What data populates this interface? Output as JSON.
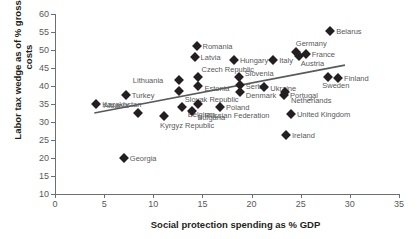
{
  "chart_data": {
    "type": "scatter",
    "title": "",
    "xlabel": "Social protection spending as % GDP",
    "ylabel": "Labor tax wedge as of % gross labor costs",
    "xlim": [
      0,
      35
    ],
    "ylim": [
      10,
      60
    ],
    "xticks": [
      0,
      5,
      10,
      15,
      20,
      25,
      30,
      35
    ],
    "yticks": [
      10,
      15,
      20,
      25,
      30,
      35,
      40,
      45,
      50,
      55,
      60
    ],
    "grid": false,
    "legend": "none",
    "marker_color": "#231f20",
    "trendline_color": "#58595b",
    "trendline": {
      "x0": 4.0,
      "y0": 32.5,
      "x1": 29.5,
      "y1": 45.8
    },
    "points": [
      {
        "label": "Kazakhstan",
        "x": 4.2,
        "y": 34.9,
        "label_dx": 6,
        "label_dy": 1
      },
      {
        "label": "Georgia",
        "x": 7.0,
        "y": 19.9,
        "label_dx": 6,
        "label_dy": 1
      },
      {
        "label": "Turkey",
        "x": 7.2,
        "y": 37.5,
        "label_dx": 6,
        "label_dy": 1
      },
      {
        "label": "Albania",
        "x": 8.4,
        "y": 32.4,
        "label_dx": -34,
        "label_dy": -7
      },
      {
        "label": "Kyrgyz Republic",
        "x": 11.1,
        "y": 31.6,
        "label_dx": -4,
        "label_dy": 10
      },
      {
        "label": "Lithuania",
        "x": 12.6,
        "y": 41.8,
        "label_dx": -46,
        "label_dy": 1
      },
      {
        "label": "Slovak Republic",
        "x": 12.6,
        "y": 38.7,
        "label_dx": 6,
        "label_dy": 9
      },
      {
        "label": "Belgium",
        "x": 12.9,
        "y": 34.3,
        "label_dx": 6,
        "label_dy": 8
      },
      {
        "label": "Bulgaria",
        "x": 13.9,
        "y": 33.0,
        "label_dx": 6,
        "label_dy": 7
      },
      {
        "label": "Latvia",
        "x": 14.2,
        "y": 48.1,
        "label_dx": 6,
        "label_dy": 1
      },
      {
        "label": "Romania",
        "x": 14.4,
        "y": 51.2,
        "label_dx": 6,
        "label_dy": 1
      },
      {
        "label": "Czech Republic",
        "x": 14.5,
        "y": 42.4,
        "label_dx": 4,
        "label_dy": -7
      },
      {
        "label": "Estonia",
        "x": 14.6,
        "y": 39.9,
        "label_dx": 6,
        "label_dy": 3
      },
      {
        "label": "Russian Federation",
        "x": 14.6,
        "y": 35.0,
        "label_dx": 6,
        "label_dy": 12
      },
      {
        "label": "Poland",
        "x": 16.8,
        "y": 34.1,
        "label_dx": 6,
        "label_dy": 1
      },
      {
        "label": "Hungary",
        "x": 18.2,
        "y": 47.3,
        "label_dx": 6,
        "label_dy": 1
      },
      {
        "label": "Slovenia",
        "x": 18.7,
        "y": 42.4,
        "label_dx": 6,
        "label_dy": -3
      },
      {
        "label": "Serbia",
        "x": 18.8,
        "y": 40.3,
        "label_dx": 6,
        "label_dy": 2
      },
      {
        "label": "Denmark",
        "x": 18.8,
        "y": 38.3,
        "label_dx": 6,
        "label_dy": 4
      },
      {
        "label": "Ukraine",
        "x": 21.3,
        "y": 39.8,
        "label_dx": 6,
        "label_dy": 2
      },
      {
        "label": "Italy",
        "x": 22.2,
        "y": 47.2,
        "label_dx": 6,
        "label_dy": 1
      },
      {
        "label": "Portugal",
        "x": 23.3,
        "y": 37.4,
        "label_dx": 6,
        "label_dy": 1
      },
      {
        "label": "Netherlands",
        "x": 23.4,
        "y": 38.4,
        "label_dx": 6,
        "label_dy": 9
      },
      {
        "label": "Ireland",
        "x": 23.5,
        "y": 26.3,
        "label_dx": 6,
        "label_dy": 1
      },
      {
        "label": "United Kingdom",
        "x": 24.0,
        "y": 32.2,
        "label_dx": 6,
        "label_dy": 1
      },
      {
        "label": "Germany",
        "x": 24.5,
        "y": 49.4,
        "label_dx": 0,
        "label_dy": -8
      },
      {
        "label": "Austria",
        "x": 24.8,
        "y": 48.2,
        "label_dx": 2,
        "label_dy": 8
      },
      {
        "label": "France",
        "x": 25.5,
        "y": 49.0,
        "label_dx": 6,
        "label_dy": 1
      },
      {
        "label": "Sweden",
        "x": 27.8,
        "y": 42.4,
        "label_dx": -6,
        "label_dy": 9
      },
      {
        "label": "Belarus",
        "x": 28.0,
        "y": 55.2,
        "label_dx": 6,
        "label_dy": 1
      },
      {
        "label": "Finland",
        "x": 28.8,
        "y": 42.3,
        "label_dx": 6,
        "label_dy": 1
      }
    ]
  }
}
